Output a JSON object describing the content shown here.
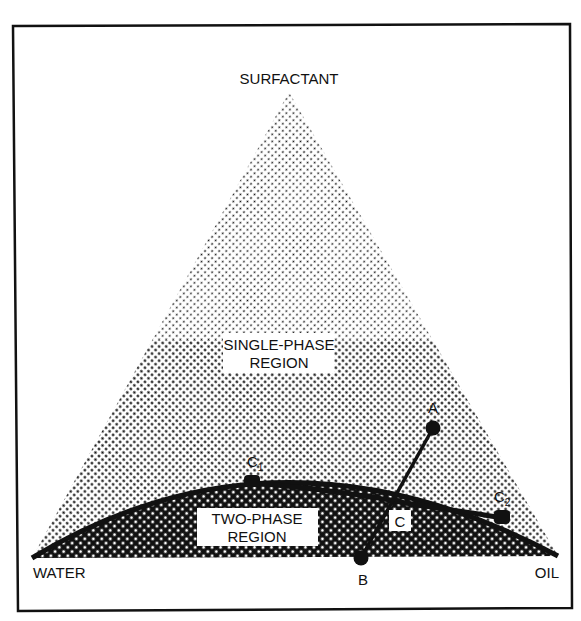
{
  "diagram": {
    "type": "ternary phase diagram",
    "vertices": {
      "top": "SURFACTANT",
      "bottom_left": "WATER",
      "bottom_right": "OIL"
    },
    "regions": {
      "single_phase": {
        "line1": "SINGLE-PHASE",
        "line2": "REGION"
      },
      "two_phase": {
        "line1": "TWO-PHASE",
        "line2": "REGION"
      }
    },
    "points": {
      "A": "A",
      "B": "B",
      "C": "C",
      "C1": {
        "base": "C",
        "sub": "1"
      },
      "C2": {
        "base": "C",
        "sub": "2"
      }
    },
    "colors": {
      "ink": "#111111",
      "background": "#ffffff"
    }
  }
}
